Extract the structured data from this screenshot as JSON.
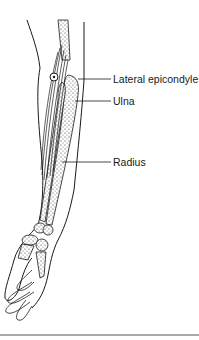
{
  "figure": {
    "labels": [
      {
        "text": "Lateral epicondyle",
        "x": 113,
        "y": 73
      },
      {
        "text": "Ulna",
        "x": 113,
        "y": 95
      },
      {
        "text": "Radius",
        "x": 113,
        "y": 156
      }
    ],
    "colors": {
      "line": "#1a1a1a",
      "bone_fill": "#e8e8e8",
      "background": "#ffffff",
      "rule": "#555555"
    }
  }
}
